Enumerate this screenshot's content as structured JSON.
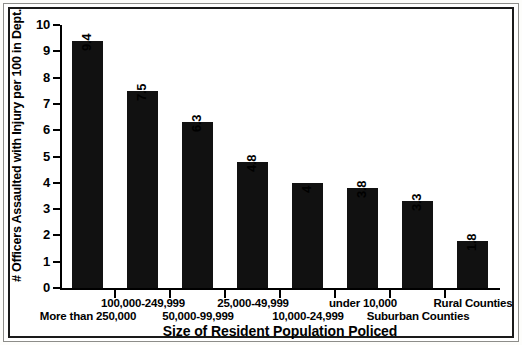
{
  "chart_data": {
    "type": "bar",
    "title": "",
    "xlabel": "Size of Resident Population Policed",
    "ylabel": "# Officers Assaulted with Injury per 100 in Dept.",
    "categories": [
      "More than 250,000",
      "100,000-249,999",
      "50,000-99,999",
      "25,000-49,999",
      "10,000-24,999",
      "under 10,000",
      "Suburban Counties",
      "Rural Counties"
    ],
    "values": [
      9.4,
      7.5,
      6.3,
      4.8,
      4,
      3.8,
      3.3,
      1.8
    ],
    "value_labels": [
      "9.4",
      "7.5",
      "6.3",
      "4.8",
      "4",
      "3.8",
      "3.3",
      "1.8"
    ],
    "ylim": [
      0,
      10
    ],
    "ytick_labels": [
      "0",
      "1",
      "2",
      "3",
      "4",
      "5",
      "6",
      "7",
      "8",
      "9",
      "10"
    ],
    "grid": false,
    "legend": false,
    "bar_color": "#111111",
    "value_label_rotation": "vertical"
  },
  "axis": {
    "y_title": "# Officers Assaulted with Injury per 100 in Dept.",
    "x_title": "Size of Resident Population Policed"
  }
}
